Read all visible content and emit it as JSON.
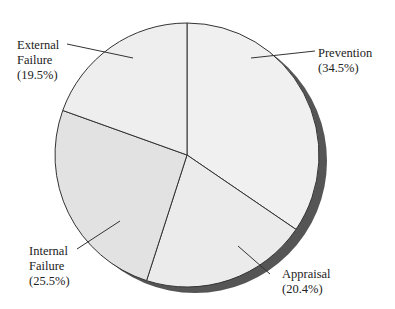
{
  "chart_data": {
    "type": "pie",
    "title": "",
    "categories": [
      "Prevention",
      "Appraisal",
      "Internal Failure",
      "External Failure"
    ],
    "values": [
      34.5,
      20.4,
      25.5,
      19.5
    ],
    "unit": "%",
    "start_angle_deg": 0,
    "direction": "clockwise",
    "slices": [
      {
        "name": "Prevention",
        "label_line1": "Prevention",
        "label_line2": "(34.5%)",
        "value": 34.5,
        "color": "#f0f0f0"
      },
      {
        "name": "Appraisal",
        "label_line1": "Appraisal",
        "label_line2": "(20.4%)",
        "value": 20.4,
        "color": "#ebebeb"
      },
      {
        "name": "Internal Failure",
        "label_line1": "Internal",
        "label_line2": "Failure",
        "label_line3": "(25.5%)",
        "value": 25.5,
        "color": "#e2e2e2"
      },
      {
        "name": "External Failure",
        "label_line1": "External",
        "label_line2": "Failure",
        "label_line3": "(19.5%)",
        "value": 19.5,
        "color": "#eeeeee"
      }
    ],
    "shadow_color": "#555555",
    "outline_color": "#333333",
    "legend": "none (callout labels)"
  }
}
